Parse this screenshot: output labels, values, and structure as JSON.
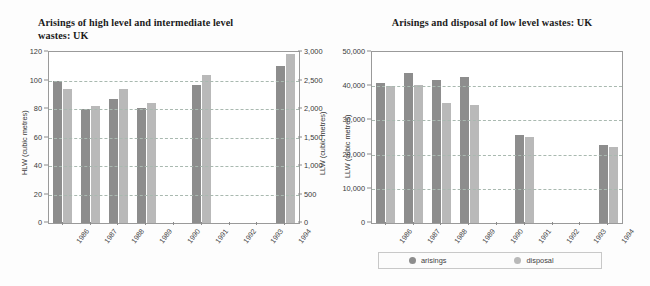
{
  "chart_data": [
    {
      "type": "bar",
      "id": "hlw-ilw",
      "title": "Arisings of high level and intermediate level wastes: UK",
      "title_line1": "Arisings of high level and intermediate level",
      "title_line2": "wastes: UK",
      "categories": [
        "1986",
        "1987",
        "1988",
        "1989",
        "1990",
        "1991",
        "1992",
        "1993",
        "1994"
      ],
      "xlabel": "",
      "ylabel": "HLW (cubic metres)",
      "ylabel_right": "LLW (cubic metres)",
      "ylim": [
        0,
        120
      ],
      "ylim_right": [
        0,
        3000
      ],
      "yticks": [
        0,
        20,
        40,
        60,
        80,
        100,
        120
      ],
      "yticklabels": [
        "0",
        "20",
        "40",
        "60",
        "80",
        "100",
        "120"
      ],
      "yticks_right": [
        0,
        500,
        1000,
        1500,
        2000,
        2500,
        3000
      ],
      "yticklabels_right": [
        "0",
        "500",
        "1,000",
        "1,500",
        "2,000",
        "2,500",
        "3,000"
      ],
      "grid": true,
      "legend_position": "none",
      "series": [
        {
          "name": "arisings",
          "axis": "left",
          "color": "#8d8d8d",
          "values": [
            100,
            80,
            87,
            81,
            null,
            97,
            null,
            null,
            110
          ]
        },
        {
          "name": "disposal",
          "axis": "right",
          "color": "#b9b9b9",
          "values": [
            2350,
            2050,
            2350,
            2110,
            null,
            2600,
            null,
            null,
            2960
          ]
        }
      ]
    },
    {
      "type": "bar",
      "id": "llw",
      "title": "Arisings and disposal of low level wastes: UK",
      "title_line1": "Arisings and disposal of low level wastes: UK",
      "title_line2": "",
      "categories": [
        "1986",
        "1987",
        "1988",
        "1989",
        "1990",
        "1991",
        "1992",
        "1993",
        "1994"
      ],
      "xlabel": "",
      "ylabel": "LLW (cubic metres)",
      "ylim": [
        0,
        50000
      ],
      "yticks": [
        0,
        10000,
        20000,
        30000,
        40000,
        50000
      ],
      "yticklabels": [
        "0",
        "10,000",
        "20,000",
        "30,000",
        "40,000",
        "50,000"
      ],
      "grid": true,
      "legend_position": "bottom",
      "series": [
        {
          "name": "arisings",
          "color": "#8d8d8d",
          "values": [
            40800,
            44000,
            41800,
            42600,
            null,
            25600,
            null,
            null,
            22700
          ]
        },
        {
          "name": "disposal",
          "color": "#b9b9b9",
          "values": [
            40200,
            40300,
            35000,
            34400,
            null,
            25200,
            null,
            null,
            22100
          ]
        }
      ]
    }
  ],
  "legend": {
    "items": [
      {
        "label": "arisings",
        "color": "#8d8d8d"
      },
      {
        "label": "disposal",
        "color": "#b9b9b9"
      }
    ]
  },
  "colors": {
    "arisings": "#8d8d8d",
    "disposal": "#b9b9b9",
    "grid": "#a9b9b0",
    "frame": "#9a9a9a",
    "text": "#3a3a3a",
    "title": "#1b1b1b",
    "background": "#fdfdfd"
  }
}
